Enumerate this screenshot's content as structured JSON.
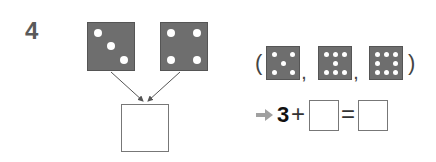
{
  "question": {
    "number": "4"
  },
  "top_dice": [
    {
      "value": 3
    },
    {
      "value": 4
    }
  ],
  "choices": {
    "open_paren": "(",
    "close_paren": ")",
    "separator": ",",
    "dice": [
      {
        "value": 5
      },
      {
        "value": 7
      },
      {
        "value": 8
      }
    ]
  },
  "equation": {
    "arrow_icon": "right-arrow-icon",
    "first_addend": "3",
    "plus": "+",
    "equals": "=",
    "second_addend_value": "",
    "sum_value": ""
  },
  "answer_box": {
    "value": ""
  },
  "colors": {
    "die_fill": "#6e6e6e",
    "dot": "#ffffff",
    "arrow": "#555555",
    "right_arrow": "#a0a0a0"
  }
}
